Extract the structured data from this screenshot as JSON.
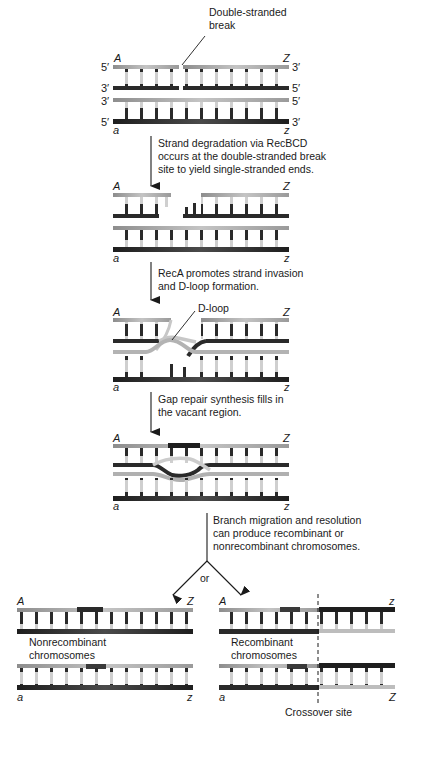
{
  "figure": {
    "steps": [
      {
        "id": "initial",
        "callout": "Double-stranded\nbreak",
        "callout_lines": [
          "Double-stranded",
          "break"
        ],
        "left_labels": [
          "5′",
          "3′",
          "3′",
          "5′"
        ],
        "right_labels": [
          "3′",
          "5′",
          "5′",
          "3′"
        ],
        "top_left": "A",
        "top_right": "Z",
        "bottom_left": "a",
        "bottom_right": "z"
      },
      {
        "id": "degradation",
        "arrow_text": [
          "Strand degradation via RecBCD",
          "occurs at the double-stranded break",
          "site to yield single-stranded ends."
        ],
        "top_left": "A",
        "top_right": "Z",
        "bottom_left": "a",
        "bottom_right": "z"
      },
      {
        "id": "invasion",
        "arrow_text": [
          "RecA promotes strand invasion",
          "and D-loop formation."
        ],
        "callout": "D-loop",
        "top_left": "A",
        "top_right": "Z",
        "bottom_left": "a",
        "bottom_right": "z"
      },
      {
        "id": "gap-repair",
        "arrow_text": [
          "Gap repair synthesis fills in",
          "the vacant region."
        ],
        "top_left": "A",
        "top_right": "Z",
        "bottom_left": "a",
        "bottom_right": "z"
      },
      {
        "id": "resolution",
        "arrow_text": [
          "Branch migration and resolution",
          "can produce recombinant or",
          "nonrecombinant chromosomes."
        ],
        "branch_word": "or"
      }
    ],
    "outcomes": {
      "nonrecombinant": {
        "label": [
          "Nonrecombinant",
          "chromosomes"
        ],
        "top_left": "A",
        "top_right": "Z",
        "bottom_left": "a",
        "bottom_right": "z"
      },
      "recombinant": {
        "label": [
          "Recombinant",
          "chromosomes"
        ],
        "top_left": "A",
        "top_right": "z",
        "bottom_left": "a",
        "bottom_right": "Z",
        "crossover_label": "Crossover site"
      }
    },
    "colors": {
      "dark_strand": "#2b2b2b",
      "light_strand": "#b9b9b9",
      "mid_strand": "#7a7a7a",
      "text": "#1a1a1a"
    }
  }
}
